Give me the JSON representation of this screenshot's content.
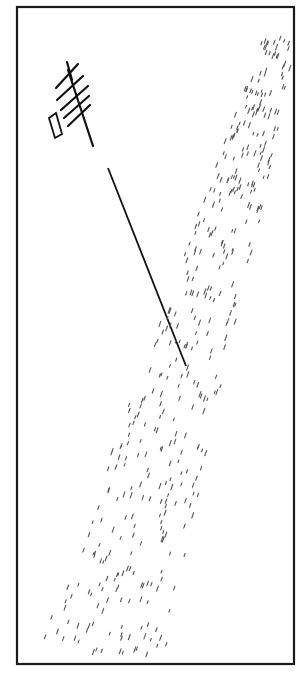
{
  "figure": {
    "frame": {
      "x": 17,
      "y": 7,
      "width": 277,
      "height": 657,
      "stroke": "#1a1a1a"
    },
    "ink_color": "#111111",
    "dash_color": "#555555",
    "main_line": {
      "x1": 108,
      "y1": 168,
      "x2": 186,
      "y2": 366
    },
    "feather_mark": {
      "spine": {
        "x1": 68,
        "y1": 70,
        "x2": 93,
        "y2": 146
      },
      "hatches": [
        {
          "x1": 56,
          "y1": 88,
          "x2": 78,
          "y2": 64
        },
        {
          "x1": 57,
          "y1": 100,
          "x2": 83,
          "y2": 76
        },
        {
          "x1": 61,
          "y1": 110,
          "x2": 88,
          "y2": 86
        },
        {
          "x1": 64,
          "y1": 118,
          "x2": 89,
          "y2": 96
        },
        {
          "x1": 68,
          "y1": 126,
          "x2": 90,
          "y2": 105
        }
      ],
      "parallelogram": "M49,118 L56,113 L62,134 L55,138 Z"
    }
  }
}
